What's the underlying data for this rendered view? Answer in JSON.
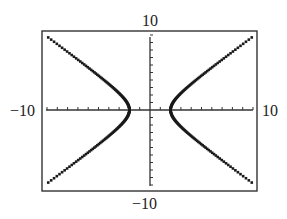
{
  "chart_data": {
    "type": "scatter",
    "title": "",
    "xlabel": "",
    "ylabel": "",
    "xlim": [
      -10,
      10
    ],
    "ylim": [
      -10,
      10
    ],
    "xscale_ticks": 1,
    "yscale_ticks": 1,
    "grid": false,
    "equation": "x^2 - y^2 = 4",
    "vertices": [
      [
        -2,
        0
      ],
      [
        2,
        0
      ]
    ],
    "series": [
      {
        "name": "right branch upper",
        "x": [
          2,
          2.5,
          3,
          4,
          5,
          6,
          7,
          8,
          9,
          10
        ],
        "y": [
          0,
          1.5,
          2.24,
          3.46,
          4.58,
          5.66,
          6.71,
          7.75,
          8.77,
          9.8
        ]
      },
      {
        "name": "right branch lower",
        "x": [
          2,
          2.5,
          3,
          4,
          5,
          6,
          7,
          8,
          9,
          10
        ],
        "y": [
          0,
          -1.5,
          -2.24,
          -3.46,
          -4.58,
          -5.66,
          -6.71,
          -7.75,
          -8.77,
          -9.8
        ]
      },
      {
        "name": "left branch upper",
        "x": [
          -2,
          -2.5,
          -3,
          -4,
          -5,
          -6,
          -7,
          -8,
          -9,
          -10
        ],
        "y": [
          0,
          1.5,
          2.24,
          3.46,
          4.58,
          5.66,
          6.71,
          7.75,
          8.77,
          9.8
        ]
      },
      {
        "name": "left branch lower",
        "x": [
          -2,
          -2.5,
          -3,
          -4,
          -5,
          -6,
          -7,
          -8,
          -9,
          -10
        ],
        "y": [
          0,
          -1.5,
          -2.24,
          -3.46,
          -4.58,
          -5.66,
          -6.71,
          -7.75,
          -8.77,
          -9.8
        ]
      }
    ]
  },
  "labels": {
    "ymax": "10",
    "ymin": "−10",
    "xmin": "−10",
    "xmax": "10"
  },
  "colors": {
    "frame": "#333333",
    "axis": "#333333",
    "curve": "#1a1a1a"
  }
}
